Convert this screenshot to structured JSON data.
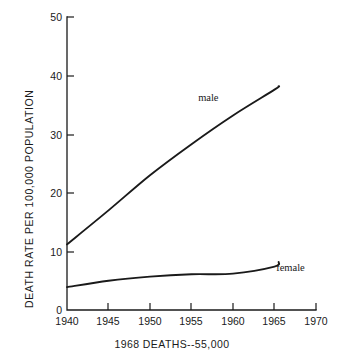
{
  "chart_data": {
    "type": "line",
    "title": "",
    "subtitle": "",
    "xlabel": "",
    "ylabel": "DEATH RATE PER 100,000 POPULATION",
    "caption": "1968 DEATHS--55,000",
    "xlim": [
      1940,
      1970
    ],
    "ylim": [
      0,
      50
    ],
    "xticks": [
      "1940",
      "1945",
      "1950",
      "1955",
      "1960",
      "1965",
      "1970"
    ],
    "yticks": [
      "0",
      "10",
      "20",
      "30",
      "40",
      "50"
    ],
    "grid": false,
    "legend_position": "inline-annotation",
    "x": [
      1940,
      1945,
      1950,
      1955,
      1960,
      1965,
      1965.5
    ],
    "series": [
      {
        "name": "male",
        "label": "male",
        "color": "#1a1a1a",
        "values": [
          11.2,
          17.0,
          23.0,
          28.3,
          33.2,
          37.6,
          38.2
        ]
      },
      {
        "name": "female",
        "label": "female",
        "color": "#1a1a1a",
        "values": [
          3.9,
          5.0,
          5.7,
          6.1,
          6.2,
          7.4,
          8.2
        ]
      }
    ],
    "annotations": [
      {
        "text": "male",
        "x": 1955.8,
        "y": 35.6
      },
      {
        "text": "female",
        "x": 1965.2,
        "y": 6.6
      }
    ]
  }
}
